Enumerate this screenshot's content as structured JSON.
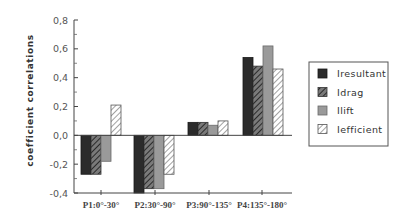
{
  "chart_data": {
    "type": "bar",
    "title": "",
    "xlabel": "",
    "ylabel": "coefficient correlations",
    "ylim": [
      -0.4,
      0.8
    ],
    "yticks": [
      "-0,4",
      "-0,2",
      "0,0",
      "0,2",
      "0,4",
      "0,6",
      "0,8"
    ],
    "ytick_values": [
      -0.4,
      -0.2,
      0.0,
      0.2,
      0.4,
      0.6,
      0.8
    ],
    "grid": false,
    "legend_position": "right",
    "categories": [
      "P1:0°-30°",
      "P2:30°-90°",
      "P3:90°-135°",
      "P4:135°-180°"
    ],
    "series": [
      {
        "name": "Iresultant",
        "style": "solid-dark",
        "color": "#2b2b2b",
        "values": [
          -0.27,
          -0.4,
          0.09,
          0.54
        ]
      },
      {
        "name": "Idrag",
        "style": "hatched-dark",
        "color": "#555555",
        "values": [
          -0.27,
          -0.37,
          0.09,
          0.48
        ]
      },
      {
        "name": "Ilift",
        "style": "solid-gray",
        "color": "#9a9a9a",
        "values": [
          -0.18,
          -0.37,
          0.07,
          0.62
        ]
      },
      {
        "name": "Iefficient",
        "style": "hatched-light",
        "color": "#dddddd",
        "values": [
          0.21,
          -0.27,
          0.1,
          0.46
        ]
      }
    ]
  }
}
